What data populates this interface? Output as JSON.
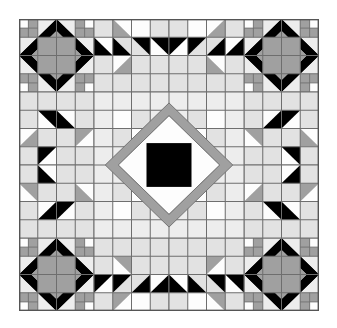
{
  "artwork": {
    "title": "Medallion Quilt Block",
    "type": "quilt-pattern",
    "grid_columns": 16,
    "grid_rows": 16,
    "canvas": {
      "width": 337,
      "height": 328
    },
    "quilt_bounds": {
      "x": 19,
      "y": 19,
      "width": 300,
      "height": 292
    }
  },
  "palette": {
    "background": "#ffffff",
    "light": "#ededed",
    "light_gray": "#e2e2e2",
    "medium_gray": "#a0a0a0",
    "white": "#fdfdfd",
    "black": "#000000",
    "grid_line": "#6e6e6e",
    "border": "#555555"
  },
  "chart_data": {
    "type": "heatmap",
    "xlabel": "",
    "ylabel": "",
    "categories": [
      "c0",
      "c1",
      "c2",
      "c3",
      "c4",
      "c5",
      "c6",
      "c7",
      "c8",
      "c9",
      "c10",
      "c11",
      "c12",
      "c13",
      "c14",
      "c15"
    ],
    "legend": [
      {
        "name": "white",
        "color": "#fdfdfd"
      },
      {
        "name": "light",
        "color": "#ededed"
      },
      {
        "name": "light-gray",
        "color": "#e2e2e2"
      },
      {
        "name": "medium-gray",
        "color": "#a0a0a0"
      },
      {
        "name": "black",
        "color": "#000000"
      }
    ],
    "grid": true,
    "legend_position": "none",
    "values": [
      [
        "white",
        "medium-gray",
        "light",
        "light",
        "light",
        "light",
        "light",
        "light",
        "light",
        "light",
        "light",
        "light",
        "light",
        "medium-gray",
        "white",
        "light"
      ],
      [
        "medium-gray",
        "medium-gray",
        "light",
        "light",
        "light",
        "light",
        "light",
        "light",
        "light",
        "light",
        "light",
        "light",
        "light",
        "medium-gray",
        "medium-gray",
        "light"
      ],
      [
        "light",
        "light",
        "medium-gray",
        "light",
        "light",
        "light",
        "light",
        "light",
        "light",
        "light",
        "light",
        "light",
        "medium-gray",
        "light",
        "light",
        "light"
      ],
      [
        "light",
        "light",
        "medium-gray",
        "light",
        "light",
        "light",
        "light",
        "light",
        "light",
        "light",
        "light",
        "light",
        "medium-gray",
        "light",
        "light",
        "light"
      ],
      [
        "light",
        "light",
        "light",
        "light",
        "light",
        "light",
        "light",
        "light",
        "light",
        "light",
        "light",
        "light",
        "light",
        "light",
        "light",
        "light"
      ],
      [
        "light",
        "light",
        "light",
        "light",
        "light",
        "white",
        "light",
        "light",
        "light",
        "light",
        "white",
        "light",
        "light",
        "light",
        "light",
        "light"
      ],
      [
        "light",
        "light",
        "light",
        "light",
        "light",
        "light",
        "light",
        "light",
        "light",
        "light",
        "light",
        "light",
        "light",
        "light",
        "light",
        "light"
      ],
      [
        "light",
        "light",
        "light",
        "light",
        "light",
        "light",
        "light",
        "black",
        "black",
        "light",
        "light",
        "light",
        "light",
        "light",
        "light",
        "light"
      ],
      [
        "light",
        "light",
        "light",
        "light",
        "light",
        "light",
        "light",
        "black",
        "black",
        "light",
        "light",
        "light",
        "light",
        "light",
        "light",
        "light"
      ],
      [
        "light",
        "light",
        "light",
        "light",
        "light",
        "light",
        "light",
        "light",
        "light",
        "light",
        "light",
        "light",
        "light",
        "light",
        "light",
        "light"
      ],
      [
        "light",
        "light",
        "light",
        "light",
        "light",
        "white",
        "light",
        "light",
        "light",
        "light",
        "white",
        "light",
        "light",
        "light",
        "light",
        "light"
      ],
      [
        "light",
        "light",
        "light",
        "light",
        "light",
        "light",
        "light",
        "light",
        "light",
        "light",
        "light",
        "light",
        "light",
        "light",
        "light",
        "light"
      ],
      [
        "light",
        "light",
        "medium-gray",
        "light",
        "light",
        "light",
        "light",
        "light",
        "light",
        "light",
        "light",
        "light",
        "medium-gray",
        "light",
        "light",
        "light"
      ],
      [
        "light",
        "light",
        "medium-gray",
        "light",
        "light",
        "light",
        "light",
        "light",
        "light",
        "light",
        "light",
        "light",
        "medium-gray",
        "light",
        "light",
        "light"
      ],
      [
        "medium-gray",
        "medium-gray",
        "light",
        "light",
        "light",
        "light",
        "light",
        "light",
        "light",
        "light",
        "light",
        "light",
        "light",
        "medium-gray",
        "medium-gray",
        "light"
      ],
      [
        "white",
        "medium-gray",
        "light",
        "light",
        "light",
        "light",
        "light",
        "light",
        "light",
        "light",
        "light",
        "light",
        "light",
        "medium-gray",
        "white",
        "light"
      ]
    ]
  },
  "blocks": {
    "corner_star": {
      "name": "corner-star-block",
      "description": "4-patch corners with black diamond ring around medium gray center"
    },
    "edge_pinwheel": {
      "name": "edge-pinwheel-block",
      "description": "half-square triangles in black and medium gray forming pinwheel"
    },
    "center_medallion": {
      "name": "center-medallion-block",
      "description": "black square with white diamond and medium gray diamond ring"
    }
  }
}
